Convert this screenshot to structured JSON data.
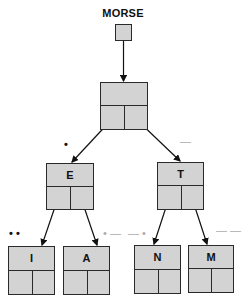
{
  "diagram": {
    "title": "MORSE",
    "nodes": {
      "root": {
        "label": ""
      },
      "e": {
        "label": "E",
        "code": "•"
      },
      "t": {
        "label": "T",
        "code": "—"
      },
      "i": {
        "label": "I",
        "code": "• •"
      },
      "a": {
        "label": "A",
        "code": "• —"
      },
      "n": {
        "label": "N",
        "code": "— •"
      },
      "m": {
        "label": "M",
        "code": "— —"
      }
    },
    "edges": [
      [
        "MORSE",
        "root"
      ],
      [
        "root",
        "E"
      ],
      [
        "root",
        "T"
      ],
      [
        "E",
        "I"
      ],
      [
        "E",
        "A"
      ],
      [
        "T",
        "N"
      ],
      [
        "T",
        "M"
      ]
    ],
    "colors": {
      "node_fill": "#d3d3d3",
      "stroke": "#2a2a2a"
    }
  }
}
